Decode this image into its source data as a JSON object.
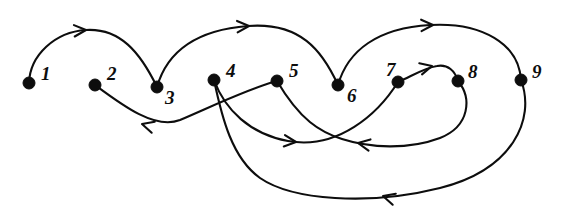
{
  "figure": {
    "background_color": "#ffffff",
    "ink_color": "#0d0d0d",
    "width": 573,
    "height": 216
  },
  "nodes": [
    {
      "id": "1",
      "label": "1",
      "x": 29,
      "y": 83,
      "r": 6,
      "label_x": 41,
      "label_y": 80
    },
    {
      "id": "2",
      "label": "2",
      "x": 95,
      "y": 85,
      "r": 6,
      "label_x": 107,
      "label_y": 80
    },
    {
      "id": "3",
      "label": "3",
      "x": 157,
      "y": 87,
      "r": 6,
      "label_x": 165,
      "label_y": 104
    },
    {
      "id": "4",
      "label": "4",
      "x": 214,
      "y": 80,
      "r": 6,
      "label_x": 226,
      "label_y": 77
    },
    {
      "id": "5",
      "label": "5",
      "x": 277,
      "y": 81,
      "r": 6,
      "label_x": 289,
      "label_y": 77
    },
    {
      "id": "6",
      "label": "6",
      "x": 338,
      "y": 85,
      "r": 6,
      "label_x": 347,
      "label_y": 102
    },
    {
      "id": "7",
      "label": "7",
      "x": 398,
      "y": 82,
      "r": 6,
      "label_x": 386,
      "label_y": 76
    },
    {
      "id": "8",
      "label": "8",
      "x": 458,
      "y": 81,
      "r": 6,
      "label_x": 468,
      "label_y": 78
    },
    {
      "id": "9",
      "label": "9",
      "x": 521,
      "y": 80,
      "r": 6,
      "label_x": 532,
      "label_y": 78
    }
  ],
  "edges": [
    {
      "id": "e1",
      "name": "edge-1-to-3",
      "from": "1",
      "to": "3",
      "direction": "right",
      "path": "M 29 83 C 30 55 55 32 86 30 C 120 28 140 52 157 87",
      "arrow": {
        "x": 86,
        "y": 30,
        "angle": -4
      }
    },
    {
      "id": "e2",
      "name": "edge-3-to-6",
      "from": "3",
      "to": "6",
      "direction": "right",
      "path": "M 157 87 C 167 52 196 30 248 26 C 300 22 322 50 338 85",
      "arrow": {
        "x": 249,
        "y": 26,
        "angle": -3
      }
    },
    {
      "id": "e3",
      "name": "edge-6-to-9",
      "from": "6",
      "to": "9",
      "direction": "right",
      "path": "M 338 85 C 348 50 378 28 430 25 C 482 22 519 44 521 80",
      "arrow": {
        "x": 433,
        "y": 25,
        "angle": -2
      }
    },
    {
      "id": "e4",
      "name": "edge-7-to-8",
      "from": "7",
      "to": "8",
      "direction": "right",
      "path": "M 398 82 C 412 76 424 68 437 66 C 448 64 455 71 458 81",
      "arrow": {
        "x": 432,
        "y": 66,
        "angle": -14
      }
    },
    {
      "id": "e5",
      "name": "edge-5-to-2",
      "from": "5",
      "to": "2",
      "direction": "left",
      "path": "M 277 81 C 250 88 215 105 180 120 C 155 130 122 105 95 85",
      "arrow": {
        "x": 142,
        "y": 124,
        "angle": 196
      }
    },
    {
      "id": "e6",
      "name": "edge-4-to-7",
      "from": "4",
      "to": "7",
      "direction": "right",
      "path": "M 214 80 C 225 110 250 134 288 141 C 338 150 378 114 398 82",
      "arrow": {
        "x": 296,
        "y": 142,
        "angle": 6
      }
    },
    {
      "id": "e7",
      "name": "edge-8-to-5",
      "from": "8",
      "to": "5",
      "direction": "left",
      "path": "M 458 81 C 472 98 470 126 440 138 C 408 150 370 148 342 139 C 320 132 300 120 277 81",
      "arrow": {
        "x": 358,
        "y": 143,
        "angle": 190
      }
    },
    {
      "id": "e8",
      "name": "edge-9-to-4",
      "from": "9",
      "to": "4",
      "direction": "left",
      "path": "M 521 80 C 536 120 512 170 440 188 C 368 206 292 200 260 178 C 232 158 222 118 214 80",
      "arrow": {
        "x": 383,
        "y": 196,
        "angle": 196
      }
    }
  ],
  "legend": {
    "node_count": 9,
    "edge_count": 8,
    "node_ids": [
      "1",
      "2",
      "3",
      "4",
      "5",
      "6",
      "7",
      "8",
      "9"
    ],
    "edge_list": [
      "1→3",
      "3→6",
      "6→9",
      "7→8",
      "5→2",
      "4→7",
      "8→5",
      "9→4"
    ]
  }
}
